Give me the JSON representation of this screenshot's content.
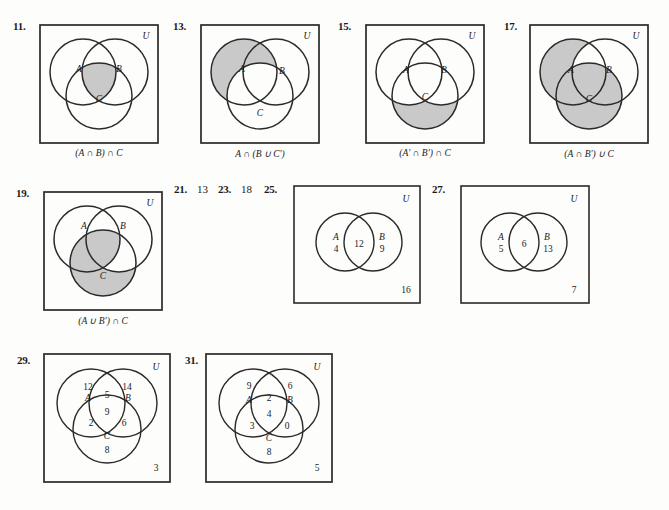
{
  "page": {
    "background": "#fdfdfb",
    "ink": "#1b1b1b",
    "shade": "#c9c9c9",
    "stroke_color": "#2a2a2a"
  },
  "problems": [
    {
      "id": "11",
      "number": "11.",
      "type": "three-circle-shaded",
      "universe_label": "U",
      "set_labels": {
        "a": "A",
        "b": "B",
        "c": "C"
      },
      "caption": "(A ∩ B) ∩ C",
      "caption_parts": [
        "(",
        "A",
        " ∩ ",
        "B",
        ") ∩ ",
        "C"
      ],
      "shaded_regions": [
        "ABC"
      ]
    },
    {
      "id": "13",
      "number": "13.",
      "type": "three-circle-shaded",
      "universe_label": "U",
      "set_labels": {
        "a": "A",
        "b": "B",
        "c": "C"
      },
      "caption": "A ∩ (B ∪ C')",
      "caption_parts": [
        "A",
        " ∩ (",
        "B",
        " ∪ ",
        "C'",
        ")"
      ],
      "shaded_regions": [
        "A-only",
        "AB-only"
      ]
    },
    {
      "id": "15",
      "number": "15.",
      "type": "three-circle-shaded",
      "universe_label": "U",
      "set_labels": {
        "a": "A",
        "b": "B",
        "c": "C"
      },
      "caption": "(A' ∩ B') ∩ C",
      "caption_parts": [
        "(",
        "A'",
        " ∩ ",
        "B'",
        ") ∩ ",
        "C"
      ],
      "shaded_regions": [
        "C-only"
      ]
    },
    {
      "id": "17",
      "number": "17.",
      "type": "three-circle-shaded",
      "universe_label": "U",
      "set_labels": {
        "a": "A",
        "b": "B",
        "c": "C"
      },
      "caption": "(A ∩ B') ∪ C",
      "caption_parts": [
        "(",
        "A",
        " ∩ ",
        "B'",
        ") ∪ ",
        "C"
      ],
      "shaded_regions": [
        "A-only",
        "AC-only",
        "ABC",
        "C-only",
        "BC-only"
      ]
    },
    {
      "id": "19",
      "number": "19.",
      "type": "three-circle-shaded",
      "universe_label": "U",
      "set_labels": {
        "a": "A",
        "b": "B",
        "c": "C"
      },
      "caption": "(A ∪ B') ∩ C",
      "caption_parts": [
        "(",
        "A",
        " ∪ ",
        "B'",
        ") ∩ ",
        "C"
      ],
      "shaded_regions": [
        "AC-only",
        "ABC",
        "C-only"
      ]
    },
    {
      "id": "21",
      "number": "21.",
      "type": "numeric-answer",
      "answer": "13"
    },
    {
      "id": "23",
      "number": "23.",
      "type": "numeric-answer",
      "answer": "18"
    },
    {
      "id": "25",
      "number": "25.",
      "type": "two-circle-counts",
      "universe_label": "U",
      "set_labels": {
        "a": "A",
        "b": "B"
      },
      "counts": {
        "a_only": "4",
        "intersection": "12",
        "b_only": "9",
        "outside": "16"
      }
    },
    {
      "id": "27",
      "number": "27.",
      "type": "two-circle-counts",
      "universe_label": "U",
      "set_labels": {
        "a": "A",
        "b": "B"
      },
      "counts": {
        "a_only": "5",
        "intersection": "6",
        "b_only": "13",
        "outside": "7"
      }
    },
    {
      "id": "29",
      "number": "29.",
      "type": "three-circle-counts",
      "universe_label": "U",
      "set_labels": {
        "a": "A",
        "b": "B",
        "c": "C"
      },
      "counts": {
        "a_only": "12",
        "ab_only": "5",
        "b_only": "14",
        "abc": "9",
        "ac_only": "2",
        "bc_only": "6",
        "c_only": "8",
        "outside": "3"
      }
    },
    {
      "id": "31",
      "number": "31.",
      "type": "three-circle-counts",
      "universe_label": "U",
      "set_labels": {
        "a": "A",
        "b": "B",
        "c": "C"
      },
      "counts": {
        "a_only": "9",
        "ab_only": "2",
        "b_only": "6",
        "abc": "4",
        "ac_only": "3",
        "bc_only": "0",
        "c_only": "8",
        "outside": "5"
      }
    }
  ]
}
